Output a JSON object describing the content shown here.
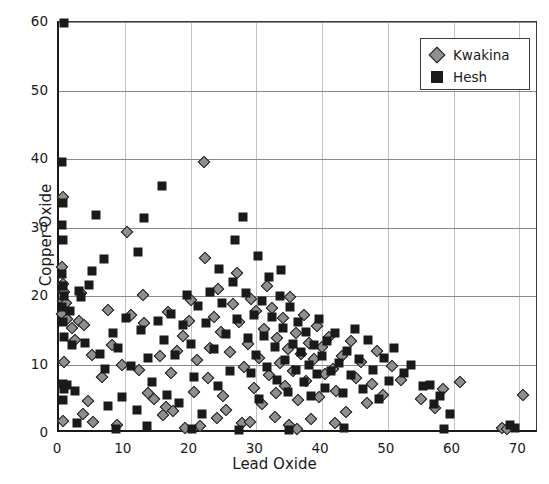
{
  "chart_data": {
    "type": "scatter",
    "title": "",
    "xlabel": "Lead Oxide",
    "ylabel": "Copper Oxide",
    "xlim": [
      0,
      73
    ],
    "ylim": [
      0,
      60
    ],
    "xticks": [
      0,
      10,
      20,
      30,
      40,
      50,
      60,
      70
    ],
    "yticks": [
      0,
      10,
      20,
      30,
      40,
      50,
      60
    ],
    "grid": "both",
    "legend_position": "top-right",
    "colors": {
      "kwakina": "#8f8f8f",
      "hesh": "#1a1a1a",
      "gridline": "#c2c2c2",
      "axis": "#1a1a1a",
      "background": "#ffffff"
    },
    "series": [
      {
        "name": "Kwakina",
        "marker": "diamond",
        "color": "#8f8f8f",
        "points": [
          [
            0.6,
            34.5
          ],
          [
            0.5,
            24.2
          ],
          [
            0.6,
            21.8
          ],
          [
            0.7,
            20.6
          ],
          [
            0.6,
            19.2
          ],
          [
            0.5,
            17.4
          ],
          [
            0.8,
            10.3
          ],
          [
            0.6,
            1.8
          ],
          [
            1.0,
            19.0
          ],
          [
            1.2,
            16.6
          ],
          [
            2.0,
            15.4
          ],
          [
            2.4,
            13.6
          ],
          [
            3.0,
            16.4
          ],
          [
            3.3,
            20.4
          ],
          [
            3.8,
            15.8
          ],
          [
            4.4,
            4.6
          ],
          [
            5.0,
            11.4
          ],
          [
            5.2,
            1.6
          ],
          [
            6.6,
            8.2
          ],
          [
            8.0,
            12.8
          ],
          [
            8.8,
            1.2
          ],
          [
            9.6,
            10.0
          ],
          [
            10.4,
            29.4
          ],
          [
            11.0,
            17.2
          ],
          [
            12.2,
            9.2
          ],
          [
            13.0,
            16.0
          ],
          [
            13.6,
            5.8
          ],
          [
            14.4,
            5.0
          ],
          [
            15.4,
            11.2
          ],
          [
            15.8,
            2.6
          ],
          [
            16.2,
            3.8
          ],
          [
            16.6,
            17.6
          ],
          [
            17.0,
            8.8
          ],
          [
            17.4,
            3.2
          ],
          [
            18.0,
            12.0
          ],
          [
            18.8,
            14.2
          ],
          [
            19.2,
            0.8
          ],
          [
            20.0,
            19.4
          ],
          [
            20.6,
            6.0
          ],
          [
            21.0,
            10.6
          ],
          [
            21.4,
            1.0
          ],
          [
            22.0,
            39.6
          ],
          [
            22.2,
            25.6
          ],
          [
            22.6,
            8.0
          ],
          [
            23.0,
            12.4
          ],
          [
            23.6,
            17.0
          ],
          [
            24.2,
            21.0
          ],
          [
            24.6,
            14.8
          ],
          [
            25.0,
            5.4
          ],
          [
            25.4,
            3.4
          ],
          [
            26.0,
            11.8
          ],
          [
            26.4,
            18.8
          ],
          [
            27.0,
            23.4
          ],
          [
            27.4,
            16.2
          ],
          [
            27.8,
            1.4
          ],
          [
            28.2,
            9.6
          ],
          [
            28.8,
            13.0
          ],
          [
            29.2,
            19.6
          ],
          [
            29.6,
            6.6
          ],
          [
            30.0,
            17.8
          ],
          [
            30.4,
            11.0
          ],
          [
            30.8,
            4.2
          ],
          [
            31.2,
            15.2
          ],
          [
            31.6,
            21.4
          ],
          [
            32.0,
            8.4
          ],
          [
            32.4,
            18.2
          ],
          [
            32.8,
            2.4
          ],
          [
            33.2,
            13.8
          ],
          [
            33.6,
            10.2
          ],
          [
            34.0,
            16.8
          ],
          [
            34.4,
            6.8
          ],
          [
            34.8,
            12.2
          ],
          [
            35.2,
            19.8
          ],
          [
            35.6,
            9.0
          ],
          [
            36.0,
            14.6
          ],
          [
            36.4,
            4.8
          ],
          [
            36.8,
            11.6
          ],
          [
            37.2,
            17.2
          ],
          [
            37.6,
            7.6
          ],
          [
            38.0,
            13.2
          ],
          [
            38.4,
            2.0
          ],
          [
            38.8,
            10.8
          ],
          [
            39.2,
            15.6
          ],
          [
            39.6,
            5.2
          ],
          [
            40.0,
            12.6
          ],
          [
            40.4,
            8.6
          ],
          [
            41.0,
            14.0
          ],
          [
            41.6,
            9.4
          ],
          [
            42.2,
            6.2
          ],
          [
            43.0,
            11.2
          ],
          [
            43.6,
            3.0
          ],
          [
            44.4,
            13.4
          ],
          [
            45.2,
            8.0
          ],
          [
            46.0,
            10.4
          ],
          [
            46.8,
            4.4
          ],
          [
            47.6,
            7.2
          ],
          [
            48.4,
            12.0
          ],
          [
            49.2,
            5.6
          ],
          [
            50.6,
            9.8
          ],
          [
            52.0,
            7.8
          ],
          [
            55.0,
            5.0
          ],
          [
            57.2,
            3.6
          ],
          [
            58.4,
            6.4
          ],
          [
            61.0,
            7.4
          ],
          [
            67.4,
            0.8
          ],
          [
            68.2,
            0.6
          ],
          [
            70.6,
            5.6
          ],
          [
            3.6,
            2.8
          ],
          [
            7.4,
            18.0
          ],
          [
            12.8,
            20.2
          ],
          [
            19.8,
            16.4
          ],
          [
            24.0,
            2.2
          ],
          [
            29.0,
            1.6
          ],
          [
            33.0,
            5.8
          ],
          [
            35.0,
            1.2
          ],
          [
            42.0,
            1.4
          ],
          [
            36.2,
            0.6
          ]
        ]
      },
      {
        "name": "Hesh",
        "marker": "square",
        "color": "#1a1a1a",
        "points": [
          [
            0.8,
            59.8
          ],
          [
            0.5,
            39.6
          ],
          [
            0.6,
            33.6
          ],
          [
            0.5,
            30.4
          ],
          [
            0.6,
            28.2
          ],
          [
            0.5,
            23.2
          ],
          [
            0.6,
            21.4
          ],
          [
            0.7,
            20.0
          ],
          [
            0.5,
            18.4
          ],
          [
            0.6,
            16.2
          ],
          [
            0.7,
            14.0
          ],
          [
            0.6,
            7.2
          ],
          [
            0.8,
            6.4
          ],
          [
            0.6,
            4.8
          ],
          [
            1.2,
            7.0
          ],
          [
            1.6,
            17.8
          ],
          [
            2.0,
            12.8
          ],
          [
            2.4,
            6.2
          ],
          [
            3.0,
            20.8
          ],
          [
            3.4,
            19.8
          ],
          [
            4.0,
            13.2
          ],
          [
            4.6,
            21.6
          ],
          [
            5.0,
            23.6
          ],
          [
            5.6,
            31.8
          ],
          [
            6.2,
            11.6
          ],
          [
            7.0,
            9.4
          ],
          [
            7.4,
            4.0
          ],
          [
            8.2,
            14.6
          ],
          [
            9.0,
            12.4
          ],
          [
            9.6,
            5.2
          ],
          [
            10.2,
            16.8
          ],
          [
            11.0,
            9.8
          ],
          [
            11.8,
            3.4
          ],
          [
            12.4,
            15.0
          ],
          [
            13.0,
            31.4
          ],
          [
            13.6,
            11.0
          ],
          [
            14.2,
            7.4
          ],
          [
            15.0,
            16.4
          ],
          [
            15.6,
            36.0
          ],
          [
            16.0,
            13.6
          ],
          [
            16.4,
            5.6
          ],
          [
            17.0,
            17.4
          ],
          [
            17.6,
            11.4
          ],
          [
            18.2,
            4.4
          ],
          [
            18.8,
            15.8
          ],
          [
            19.4,
            20.2
          ],
          [
            20.0,
            13.0
          ],
          [
            20.6,
            8.2
          ],
          [
            21.2,
            18.6
          ],
          [
            21.8,
            2.8
          ],
          [
            22.4,
            16.0
          ],
          [
            23.0,
            20.6
          ],
          [
            23.6,
            12.2
          ],
          [
            24.2,
            6.8
          ],
          [
            24.8,
            19.0
          ],
          [
            25.4,
            14.4
          ],
          [
            26.0,
            9.0
          ],
          [
            26.4,
            22.0
          ],
          [
            27.0,
            16.6
          ],
          [
            27.4,
            0.4
          ],
          [
            28.0,
            31.6
          ],
          [
            28.4,
            20.4
          ],
          [
            28.8,
            13.8
          ],
          [
            29.2,
            8.8
          ],
          [
            29.6,
            17.2
          ],
          [
            30.0,
            11.4
          ],
          [
            30.4,
            5.0
          ],
          [
            30.8,
            19.2
          ],
          [
            31.2,
            14.2
          ],
          [
            31.6,
            9.6
          ],
          [
            32.0,
            22.8
          ],
          [
            32.4,
            17.0
          ],
          [
            32.8,
            12.6
          ],
          [
            33.2,
            7.8
          ],
          [
            33.6,
            20.0
          ],
          [
            34.0,
            15.4
          ],
          [
            34.4,
            10.6
          ],
          [
            34.8,
            6.0
          ],
          [
            35.2,
            18.4
          ],
          [
            35.6,
            13.0
          ],
          [
            36.0,
            9.2
          ],
          [
            36.4,
            16.2
          ],
          [
            36.8,
            11.8
          ],
          [
            37.2,
            7.4
          ],
          [
            37.6,
            14.8
          ],
          [
            38.0,
            10.0
          ],
          [
            38.4,
            5.4
          ],
          [
            38.8,
            12.8
          ],
          [
            39.2,
            8.6
          ],
          [
            39.6,
            16.6
          ],
          [
            40.0,
            11.2
          ],
          [
            40.4,
            6.6
          ],
          [
            40.8,
            13.4
          ],
          [
            41.4,
            9.0
          ],
          [
            42.0,
            14.6
          ],
          [
            42.6,
            10.2
          ],
          [
            43.2,
            5.8
          ],
          [
            43.8,
            12.0
          ],
          [
            44.4,
            8.4
          ],
          [
            45.0,
            15.2
          ],
          [
            45.6,
            10.8
          ],
          [
            46.2,
            6.4
          ],
          [
            47.0,
            13.6
          ],
          [
            47.8,
            9.2
          ],
          [
            48.6,
            5.0
          ],
          [
            49.4,
            11.0
          ],
          [
            50.2,
            7.6
          ],
          [
            51.0,
            12.4
          ],
          [
            52.4,
            8.8
          ],
          [
            53.6,
            10.0
          ],
          [
            55.4,
            6.8
          ],
          [
            56.4,
            7.0
          ],
          [
            57.0,
            4.2
          ],
          [
            58.0,
            5.4
          ],
          [
            58.6,
            0.6
          ],
          [
            59.4,
            2.8
          ],
          [
            68.6,
            1.2
          ],
          [
            69.4,
            0.8
          ],
          [
            24.4,
            24.0
          ],
          [
            30.2,
            25.8
          ],
          [
            33.8,
            23.8
          ],
          [
            26.8,
            28.2
          ],
          [
            12.0,
            26.4
          ],
          [
            6.8,
            25.4
          ],
          [
            35.0,
            0.4
          ],
          [
            43.4,
            0.8
          ],
          [
            20.2,
            0.6
          ],
          [
            2.8,
            1.4
          ],
          [
            8.6,
            0.6
          ],
          [
            13.4,
            1.0
          ]
        ]
      }
    ]
  },
  "legend": {
    "items": [
      {
        "label": "Kwakina",
        "marker": "diamond"
      },
      {
        "label": "Hesh",
        "marker": "square"
      }
    ]
  },
  "axes": {
    "x_title": "Lead Oxide",
    "y_title": "Copper Oxide",
    "x_tick_labels": [
      "0",
      "10",
      "20",
      "30",
      "40",
      "50",
      "60",
      "70"
    ],
    "y_tick_labels": [
      "0",
      "10",
      "20",
      "30",
      "40",
      "50",
      "60"
    ]
  }
}
